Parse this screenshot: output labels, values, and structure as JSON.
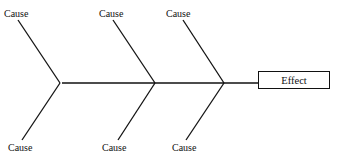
{
  "diagram": {
    "type": "fishbone (cause-and-effect) diagram",
    "effect": {
      "label": "Effect"
    },
    "causes_top": [
      {
        "label": "Cause"
      },
      {
        "label": "Cause"
      },
      {
        "label": "Cause"
      }
    ],
    "causes_bottom": [
      {
        "label": "Cause"
      },
      {
        "label": "Cause"
      },
      {
        "label": "Cause"
      }
    ],
    "colors": {
      "line": "#111111",
      "background": "#ffffff"
    }
  }
}
